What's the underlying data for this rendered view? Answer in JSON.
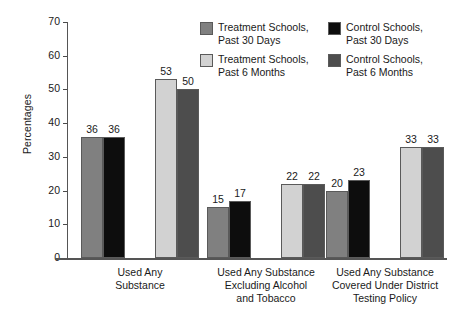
{
  "chart_data": {
    "type": "bar",
    "title": "",
    "xlabel": "",
    "ylabel": "Percentages",
    "ylim": [
      0,
      70
    ],
    "yticks": [
      0,
      10,
      20,
      30,
      40,
      50,
      60,
      70
    ],
    "ytick_labels": [
      "0",
      "10",
      "20",
      "30",
      "40",
      "50",
      "60",
      "70"
    ],
    "grid": false,
    "legend_position": "top-right",
    "categories": [
      "Used Any\nSubstance",
      "Used Any Substance\nExcluding Alcohol\nand Tobacco",
      "Used Any Substance\nCovered Under District\nTesting Policy"
    ],
    "series": [
      {
        "name": "Treatment Schools,\nPast 30 Days",
        "color": "#808080",
        "values": [
          36,
          15,
          20
        ],
        "value_labels": [
          "36",
          "15",
          "20"
        ]
      },
      {
        "name": "Control Schools,\nPast 30 Days",
        "color": "#0d0d0d",
        "values": [
          36,
          17,
          23
        ],
        "value_labels": [
          "36",
          "17",
          "23"
        ]
      },
      {
        "name": "Treatment Schools,\nPast 6 Months",
        "color": "#d2d2d2",
        "values": [
          53,
          22,
          33
        ],
        "value_labels": [
          "53",
          "22",
          "33"
        ]
      },
      {
        "name": "Control Schools,\nPast 6 Months",
        "color": "#4d4d4d",
        "values": [
          50,
          22,
          33
        ],
        "value_labels": [
          "50",
          "22",
          "33"
        ]
      }
    ]
  },
  "axis": {
    "y_title": "Percentages"
  },
  "legend": {
    "entries": [
      {
        "label": "Treatment Schools,\nPast 30 Days",
        "color": "#808080"
      },
      {
        "label": "Control Schools,\nPast 30 Days",
        "color": "#0d0d0d"
      },
      {
        "label": "Treatment Schools,\nPast 6 Months",
        "color": "#d2d2d2"
      },
      {
        "label": "Control Schools,\nPast 6 Months",
        "color": "#4d4d4d"
      }
    ]
  }
}
